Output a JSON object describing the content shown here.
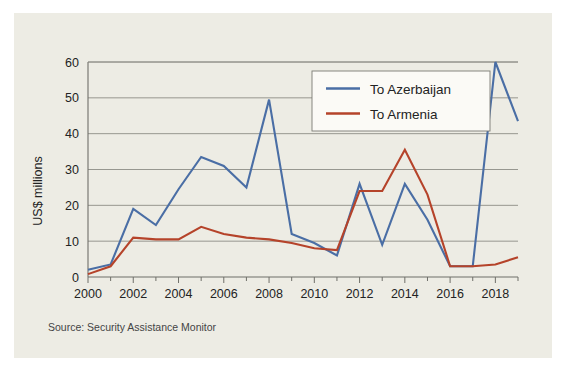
{
  "figure": {
    "background_color": "#ffffff",
    "card_color": "#edece4"
  },
  "source": {
    "label": "Source: Security Assistance Monitor"
  },
  "chart_data": {
    "type": "line",
    "title": "",
    "subtitle": "",
    "xlabel": "",
    "ylabel": "US$ millions",
    "xlim": [
      2000,
      2019
    ],
    "ylim": [
      0,
      60
    ],
    "ytick_values": [
      0,
      10,
      20,
      30,
      40,
      50,
      60
    ],
    "ytick_labels": [
      "0",
      "10",
      "20",
      "30",
      "40",
      "50",
      "60"
    ],
    "xtick_values": [
      2000,
      2002,
      2004,
      2006,
      2008,
      2010,
      2012,
      2014,
      2016,
      2018
    ],
    "xtick_labels": [
      "2000",
      "2002",
      "2004",
      "2006",
      "2008",
      "2010",
      "2012",
      "2014",
      "2016",
      "2018"
    ],
    "x_minor_ticks": [
      2001,
      2003,
      2005,
      2007,
      2009,
      2011,
      2013,
      2015,
      2017,
      2019
    ],
    "grid": true,
    "grid_axis": "y",
    "legend_position": "upper center",
    "x": [
      2000,
      2001,
      2002,
      2003,
      2004,
      2005,
      2006,
      2007,
      2008,
      2009,
      2010,
      2011,
      2012,
      2013,
      2014,
      2015,
      2016,
      2017,
      2018,
      2019
    ],
    "series": [
      {
        "name": "To Azerbaijan",
        "color": "#4a6ea5",
        "values": [
          2.0,
          3.5,
          19.0,
          14.5,
          24.5,
          33.5,
          31.0,
          25.0,
          49.5,
          12.0,
          9.5,
          6.0,
          26.0,
          9.0,
          26.0,
          16.0,
          3.0,
          3.0,
          60.0,
          43.5
        ]
      },
      {
        "name": "To Armenia",
        "color": "#b5432a",
        "values": [
          0.8,
          3.0,
          11.0,
          10.5,
          10.5,
          14.0,
          12.0,
          11.0,
          10.5,
          9.5,
          8.0,
          7.5,
          24.0,
          24.0,
          35.5,
          23.0,
          3.0,
          3.0,
          3.5,
          5.5
        ]
      }
    ]
  },
  "legend": {
    "entries": [
      {
        "label": "To Azerbaijan",
        "color": "#4a6ea5"
      },
      {
        "label": "To Armenia",
        "color": "#b5432a"
      }
    ]
  }
}
